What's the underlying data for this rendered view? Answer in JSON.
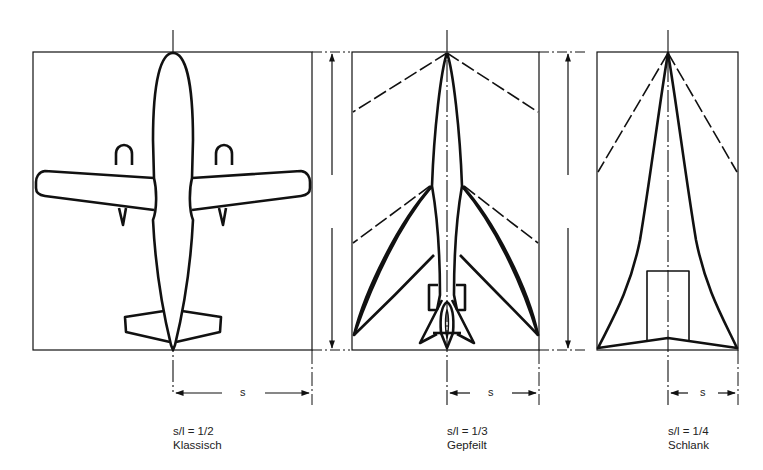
{
  "figure": {
    "panels": [
      {
        "id": "klassisch",
        "ratio": "s/l = 1/2",
        "name": "Klassisch",
        "span_label": "s"
      },
      {
        "id": "gepfeilt",
        "ratio": "s/l = 1/3",
        "name": "Gepfeilt",
        "span_label": "s"
      },
      {
        "id": "schlank",
        "ratio": "s/l = 1/4",
        "name": "Schlank",
        "span_label": "s"
      }
    ],
    "colors": {
      "line": "#111111",
      "background": "#ffffff"
    }
  }
}
